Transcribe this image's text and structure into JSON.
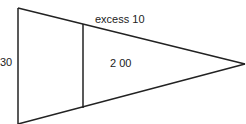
{
  "diagram": {
    "labels": {
      "left_side": "30",
      "top_edge": "excess 10",
      "inner_area": "2 00"
    },
    "colors": {
      "stroke": "#222222",
      "background": "#ffffff"
    }
  }
}
